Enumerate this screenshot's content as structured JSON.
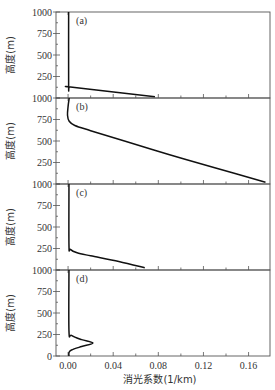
{
  "chart_data": {
    "type": "line",
    "layout": "4 vertically stacked panels sharing x-axis",
    "xlabel": "消光系数(1/km)",
    "ylabel": "高度(m)",
    "xlim": [
      -0.0107,
      0.179
    ],
    "x_ticks": [
      0.0,
      0.04,
      0.08,
      0.12,
      0.16
    ],
    "x_tick_labels": [
      "0.00",
      "0.04",
      "0.08",
      "0.12",
      "0.16"
    ],
    "grid": false,
    "legend": null,
    "panels": [
      {
        "label": "(a)",
        "ylim": [
          0,
          1000
        ],
        "y_tick_labels": [
          "1000",
          "750",
          "500",
          "250",
          "1000"
        ],
        "series": [
          {
            "name": "(a)",
            "x": [
              0.0005,
              0.0005,
              0.001,
              0.004,
              0.077
            ],
            "y": [
              1000,
              150,
              130,
              125,
              15
            ]
          }
        ]
      },
      {
        "label": "(b)",
        "ylim": [
          0,
          1000
        ],
        "y_tick_labels": [
          "750",
          "500",
          "250",
          "1000"
        ],
        "series": [
          {
            "name": "(b)",
            "x": [
              0.001,
              0.0,
              -0.0005,
              0.001,
              0.006,
              0.02,
              0.05,
              0.09,
              0.13,
              0.175
            ],
            "y": [
              1000,
              900,
              800,
              730,
              680,
              620,
              500,
              340,
              190,
              20
            ]
          }
        ]
      },
      {
        "label": "(c)",
        "ylim": [
          0,
          1000
        ],
        "y_tick_labels": [
          "750",
          "500",
          "250",
          "1000"
        ],
        "series": [
          {
            "name": "(c)",
            "x": [
              0.0008,
              0.0008,
              0.002,
              0.008,
              0.02,
              0.045,
              0.068
            ],
            "y": [
              1000,
              290,
              240,
              200,
              165,
              100,
              25
            ]
          }
        ]
      },
      {
        "label": "(d)",
        "ylim": [
          0,
          1000
        ],
        "y_tick_labels": [
          "750",
          "500",
          "250",
          "0"
        ],
        "series": [
          {
            "name": "(d)",
            "x": [
              0.0008,
              0.0008,
              0.003,
              0.012,
              0.022,
              0.012,
              0.003,
              0.0008,
              0.0008
            ],
            "y": [
              1000,
              290,
              240,
              190,
              150,
              110,
              70,
              40,
              0
            ]
          }
        ]
      }
    ]
  },
  "labels": {
    "xlabel": "消光系数(1/km)",
    "ylabel": "高度(m)"
  }
}
